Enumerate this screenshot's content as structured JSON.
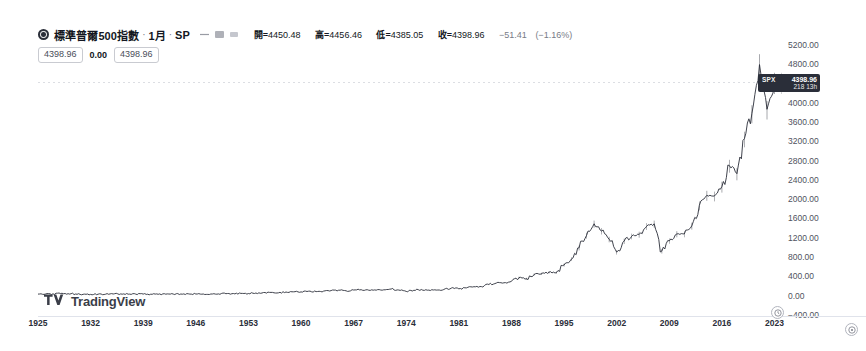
{
  "symbol": {
    "logo_icon": "sp-globe-icon",
    "title": "標準普爾500指數",
    "separator": "·",
    "interval": "1月",
    "exchange": "SP"
  },
  "legend_icons": [
    {
      "name": "eye-icon"
    },
    {
      "name": "chart-style-icon"
    },
    {
      "name": "more-options-icon"
    }
  ],
  "ohlc": {
    "open_label": "開=",
    "open": "4450.48",
    "high_label": "高=",
    "high": "4456.46",
    "low_label": "低=",
    "low": "4385.05",
    "close_label": "收=",
    "close": "4398.96",
    "change": "−51.41",
    "change_percent": "(−1.16%)"
  },
  "value_pills": {
    "left": "4398.96",
    "middle": "0.00",
    "right": "4398.96"
  },
  "price_badge": {
    "symbol": "SPX",
    "value": "4398.96",
    "countdown": "218 13h"
  },
  "price_axis": {
    "labels": [
      "5200.00",
      "4800.00",
      "4000.00",
      "3600.00",
      "3200.00",
      "2800.00",
      "2400.00",
      "2000.00",
      "1600.00",
      "1200.00",
      "800.00",
      "400.00",
      "0.00",
      "−400.00"
    ],
    "values": [
      5200,
      4800,
      4000,
      3600,
      3200,
      2800,
      2400,
      2000,
      1600,
      1200,
      800,
      400,
      0,
      -400
    ]
  },
  "time_axis": {
    "labels": [
      "1925",
      "1932",
      "1939",
      "1946",
      "1953",
      "1960",
      "1967",
      "1974",
      "1981",
      "1988",
      "1995",
      "2002",
      "2009",
      "2016",
      "2023"
    ]
  },
  "watermark": {
    "icon": "tradingview-bolt-icon",
    "text": "TradingView"
  },
  "corner_buttons": [
    {
      "name": "timezone-clock-icon"
    },
    {
      "name": "settings-clock-icon"
    }
  ],
  "colors": {
    "line": "#2a2e39",
    "badge_bg": "#2a2e39",
    "axis_text": "#4f5360",
    "grid": "#e0e3eb"
  },
  "chart_data": {
    "type": "line",
    "title": "標準普爾500指數 · 1月 · SP",
    "xlabel": "",
    "ylabel": "",
    "xlim": [
      1925,
      2024
    ],
    "ylim": [
      -400,
      5400
    ],
    "grid": false,
    "legend": "none",
    "reference_line": 4398.96,
    "series": [
      {
        "name": "SPX",
        "x": [
          1925,
          1926,
          1927,
          1928,
          1929,
          1930,
          1931,
          1932,
          1933,
          1934,
          1935,
          1936,
          1937,
          1938,
          1939,
          1940,
          1941,
          1942,
          1943,
          1944,
          1945,
          1946,
          1947,
          1948,
          1949,
          1950,
          1951,
          1952,
          1953,
          1954,
          1955,
          1956,
          1957,
          1958,
          1959,
          1960,
          1961,
          1962,
          1963,
          1964,
          1965,
          1966,
          1967,
          1968,
          1969,
          1970,
          1971,
          1972,
          1973,
          1974,
          1975,
          1976,
          1977,
          1978,
          1979,
          1980,
          1981,
          1982,
          1983,
          1984,
          1985,
          1986,
          1987,
          1988,
          1989,
          1990,
          1991,
          1992,
          1993,
          1994,
          1995,
          1996,
          1997,
          1998,
          1999,
          2000,
          2001,
          2002,
          2003,
          2004,
          2005,
          2006,
          2007,
          2008,
          2009,
          2010,
          2011,
          2012,
          2013,
          2014,
          2015,
          2016,
          2017,
          2018,
          2019,
          2020,
          2021,
          2022,
          2023,
          2024
        ],
        "values": [
          11.2,
          13.5,
          17.7,
          24.4,
          21.5,
          15.3,
          8.1,
          6.9,
          10.1,
          9.5,
          13.4,
          17.2,
          10.5,
          13.2,
          12.5,
          10.6,
          8.7,
          9.8,
          11.7,
          13.3,
          17.4,
          15.3,
          15.3,
          15.2,
          16.8,
          20.4,
          23.8,
          26.6,
          24.8,
          36.0,
          45.5,
          46.7,
          39.9,
          55.2,
          59.9,
          58.1,
          71.6,
          63.1,
          75.0,
          84.8,
          92.4,
          80.3,
          96.5,
          103.9,
          92.1,
          92.2,
          102.1,
          118.1,
          97.6,
          68.6,
          90.2,
          107.5,
          95.1,
          96.1,
          108.0,
          136.0,
          122.6,
          140.6,
          164.9,
          167.2,
          211.3,
          242.2,
          247.1,
          277.7,
          353.4,
          330.2,
          417.1,
          435.7,
          466.5,
          459.3,
          615.9,
          740.7,
          970.4,
          1229.2,
          1469.3,
          1320.3,
          1148.1,
          879.8,
          1111.9,
          1211.9,
          1248.3,
          1418.3,
          1468.4,
          903.2,
          1115.1,
          1257.6,
          1257.6,
          1426.2,
          1848.4,
          2058.9,
          2043.9,
          2238.8,
          2673.6,
          2506.8,
          3230.8,
          3756.1,
          4766.2,
          3839.5,
          4398.96,
          4398.96
        ],
        "color": "#2a2e39"
      }
    ]
  }
}
